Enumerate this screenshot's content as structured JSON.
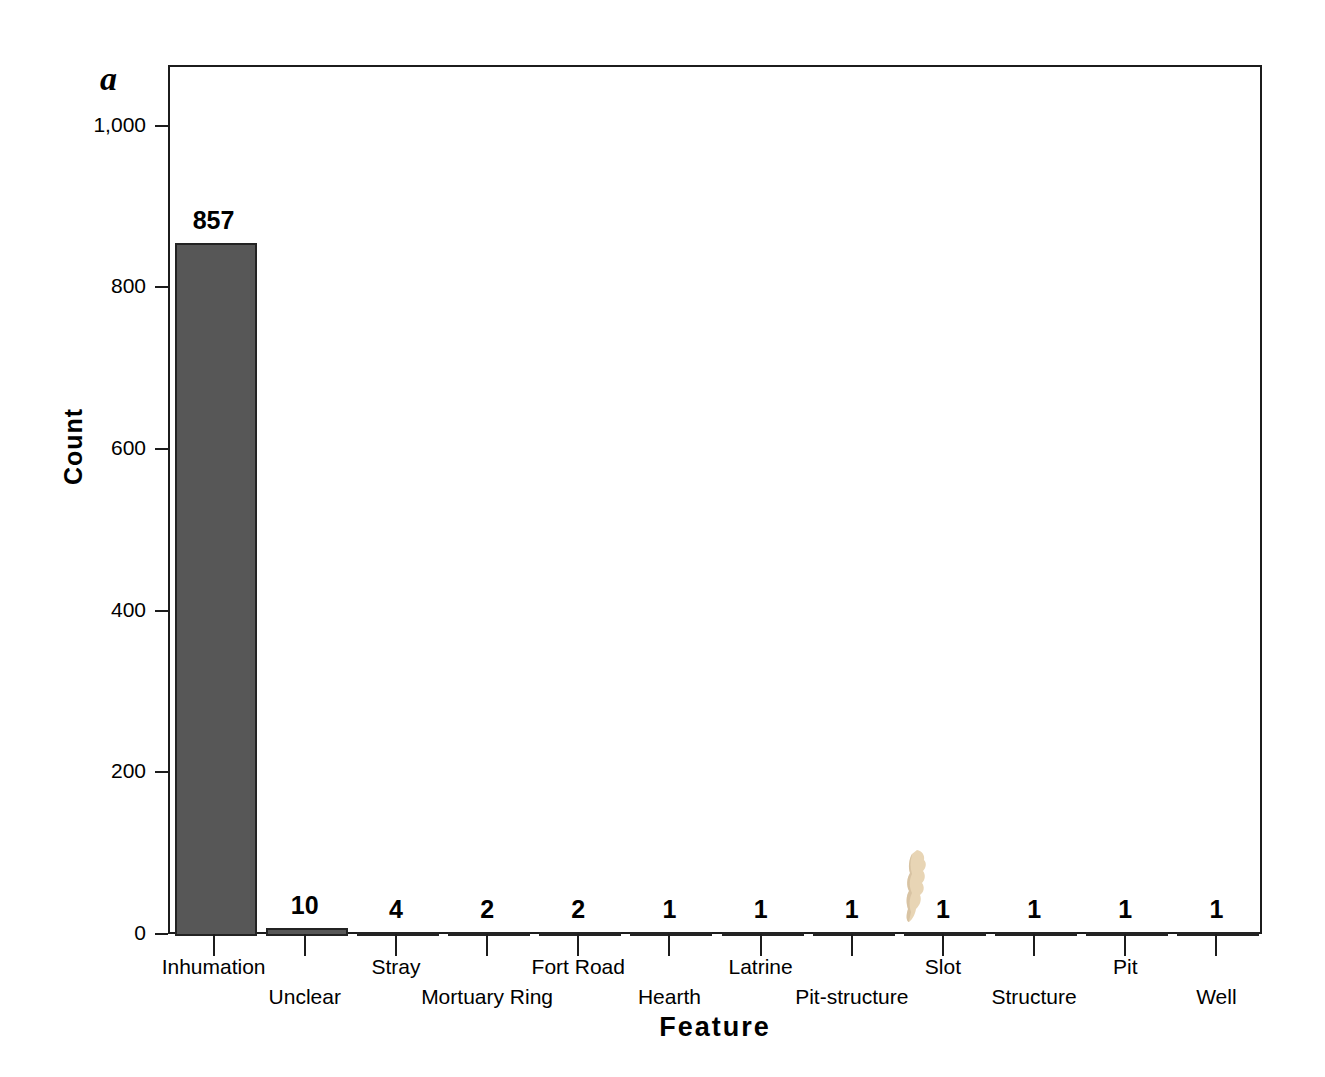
{
  "panel": {
    "label": "a"
  },
  "chart_data": {
    "type": "bar",
    "title": "",
    "xlabel": "Feature",
    "ylabel": "Count",
    "categories": [
      "Inhumation",
      "Unclear",
      "Stray",
      "Mortuary Ring",
      "Fort Road",
      "Hearth",
      "Latrine",
      "Pit-structure",
      "Slot",
      "Structure",
      "Pit",
      "Well"
    ],
    "values": [
      857,
      10,
      4,
      2,
      2,
      1,
      1,
      1,
      1,
      1,
      1,
      1
    ],
    "value_labels": [
      "857",
      "10",
      "4",
      "2",
      "2",
      "1",
      "1",
      "1",
      "1",
      "1",
      "1",
      "1"
    ],
    "ylim": [
      0,
      1075
    ],
    "yticks": [
      0,
      200,
      400,
      600,
      800,
      1000
    ],
    "ytick_labels": [
      "0",
      "200",
      "400",
      "600",
      "800",
      "1,000"
    ],
    "grid": false,
    "legend": null,
    "bar_color": "#575757",
    "bar_edge_color": "#232323",
    "axis_color": "#1c1c1c",
    "label_rows": [
      "top",
      "bottom",
      "top",
      "bottom",
      "top",
      "bottom",
      "top",
      "bottom",
      "top",
      "bottom",
      "top",
      "bottom"
    ]
  },
  "artifact": {
    "name": "scan-artifact",
    "color": "#e8d5b5",
    "shadow_color": "#cbb493"
  }
}
